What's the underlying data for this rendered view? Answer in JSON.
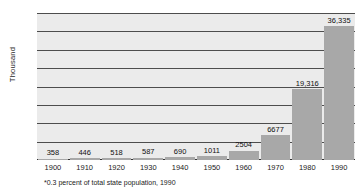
{
  "chart_data": {
    "type": "bar",
    "title": "",
    "subtitle": "",
    "xlabel": "",
    "ylabel": "Thousand",
    "categories": [
      "1900",
      "1910",
      "1920",
      "1930",
      "1940",
      "1950",
      "1960",
      "1970",
      "1980",
      "1990"
    ],
    "values": [
      358,
      446,
      518,
      587,
      690,
      1011,
      2504,
      6677,
      19316,
      36335
    ],
    "value_labels": [
      "358",
      "446",
      "518",
      "587",
      "690",
      "1011",
      "2504",
      "6677",
      "19,316",
      "36,335"
    ],
    "value_units": "thousands",
    "ylim": [
      0,
      40
    ],
    "y_ticks": [
      0,
      5,
      10,
      15,
      20,
      25,
      30,
      35,
      40
    ],
    "y_tick_labels": [
      "0",
      "5",
      "10",
      "15",
      "20",
      "25",
      "30",
      "35",
      "40"
    ],
    "grid": true,
    "legend": "none",
    "annotations": [
      "*0.3 percent of total state population, 1990"
    ],
    "colors": {
      "bar_fill": "#a8a8a8",
      "plot_background": "#ebebeb",
      "gridline": "#4d4d4d",
      "text": "#1a1a1a",
      "page_background": "#ffffff"
    }
  },
  "footnote": {
    "text": "*0.3 percent of total state population, 1990"
  }
}
